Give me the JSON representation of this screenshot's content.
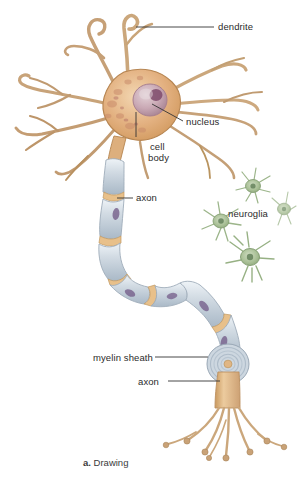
{
  "figure": {
    "caption_marker": "a.",
    "caption_text": "Drawing"
  },
  "labels": [
    {
      "id": "dendrite",
      "text": "dendrite",
      "x": 218,
      "y": 21
    },
    {
      "id": "nucleus",
      "text": "nucleus",
      "x": 186,
      "y": 116
    },
    {
      "id": "cell-body-1",
      "text": "cell",
      "x": 150,
      "y": 141
    },
    {
      "id": "cell-body-2",
      "text": "body",
      "x": 148,
      "y": 152
    },
    {
      "id": "axon-upper",
      "text": "axon",
      "x": 136,
      "y": 192
    },
    {
      "id": "neuroglia",
      "text": "neuroglia",
      "x": 228,
      "y": 208
    },
    {
      "id": "myelin-sheath",
      "text": "myelin sheath",
      "x": 93,
      "y": 352
    },
    {
      "id": "axon-lower",
      "text": "axon",
      "x": 138,
      "y": 376
    }
  ],
  "leaders": [
    {
      "id": "leader-dendrite",
      "x1": 136,
      "y1": 27,
      "x2": 214,
      "y2": 27
    },
    {
      "id": "leader-nucleus",
      "x1": 152,
      "y1": 104,
      "x2": 183,
      "y2": 121
    },
    {
      "id": "leader-cell-body",
      "x1": 136,
      "y1": 112,
      "x2": 136,
      "y2": 137
    },
    {
      "id": "leader-axon-upper",
      "x1": 117,
      "y1": 198,
      "x2": 133,
      "y2": 198
    },
    {
      "id": "leader-myelin",
      "x1": 155,
      "y1": 357,
      "x2": 208,
      "y2": 357
    },
    {
      "id": "leader-axon-lower",
      "x1": 168,
      "y1": 381,
      "x2": 220,
      "y2": 381
    }
  ],
  "colors": {
    "soma_fill": "#e0aa72",
    "soma_light": "#f0cda4",
    "soma_edge": "#b08048",
    "dendrite": "#cfa376",
    "dendrite_edge": "#a87f52",
    "nucleus": "#c8a6b2",
    "nucleolus": "#7e4a6b",
    "myelin": "#c9d3dc",
    "myelin_light": "#e6ecf1",
    "myelin_edge": "#9aa8b6",
    "node_ranvier": "#e3b878",
    "schwann_nucleus": "#6b5080",
    "axon_core": "#dcb184",
    "neuroglia": "#a8bf95",
    "neuroglia_edge": "#7f9a6d",
    "neuroglia_nucleus": "#5f7d56",
    "label_text": "#2b2b2b",
    "leader_line": "#333333",
    "background": "#ffffff"
  },
  "parts": {
    "dendrite_count": 9,
    "neuroglia_count": 4,
    "myelin_segments": 9,
    "terminal_branches": 8
  }
}
